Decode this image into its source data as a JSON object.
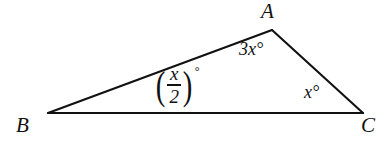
{
  "figure": {
    "type": "triangle-diagram",
    "background_color": "#ffffff",
    "stroke_color": "#111111",
    "stroke_width": 2,
    "vertices": {
      "A": {
        "label": "A",
        "x": 272,
        "y": 30
      },
      "B": {
        "label": "B",
        "x": 48,
        "y": 113
      },
      "C": {
        "label": "C",
        "x": 363,
        "y": 113
      }
    },
    "sides": [
      {
        "name": "BA",
        "from": "B",
        "to": "A"
      },
      {
        "name": "AC",
        "from": "A",
        "to": "C"
      },
      {
        "name": "BC",
        "from": "B",
        "to": "C"
      }
    ],
    "angles": {
      "at_A": {
        "text": "3x°"
      },
      "at_B": {
        "numerator": "x",
        "denominator": "2",
        "left_paren": "(",
        "right_paren": ")",
        "degree": "°"
      },
      "at_C": {
        "text": "x°"
      }
    }
  }
}
